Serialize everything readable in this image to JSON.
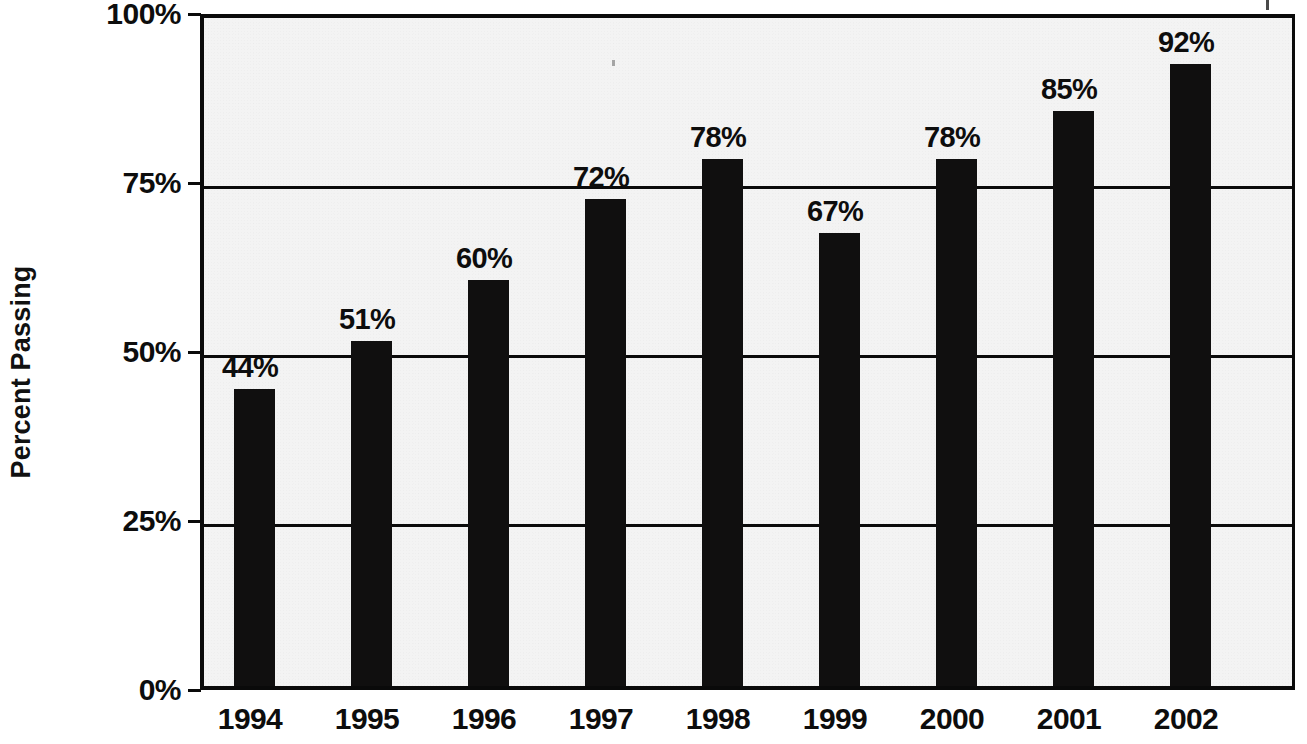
{
  "chart_data": {
    "type": "bar",
    "title": "",
    "xlabel": "",
    "ylabel": "Percent Passing",
    "categories": [
      "1994",
      "1995",
      "1996",
      "1997",
      "1998",
      "1999",
      "2000",
      "2001",
      "2002"
    ],
    "values": [
      44,
      51,
      60,
      72,
      78,
      67,
      78,
      85,
      92
    ],
    "value_labels": [
      "44%",
      "51%",
      "60%",
      "72%",
      "78%",
      "67%",
      "78%",
      "85%",
      "92%"
    ],
    "ylim": [
      0,
      100
    ],
    "y_ticks": [
      0,
      25,
      50,
      75,
      100
    ],
    "y_tick_labels": [
      "0%",
      "25%",
      "50%",
      "75%",
      "100%"
    ],
    "grid": true,
    "legend": null,
    "bar_color": "#100f0f",
    "plot_background": "#f3f3f3",
    "axis_color": "#0a0a0a"
  },
  "axes": {
    "y_title": "Percent Passing"
  }
}
